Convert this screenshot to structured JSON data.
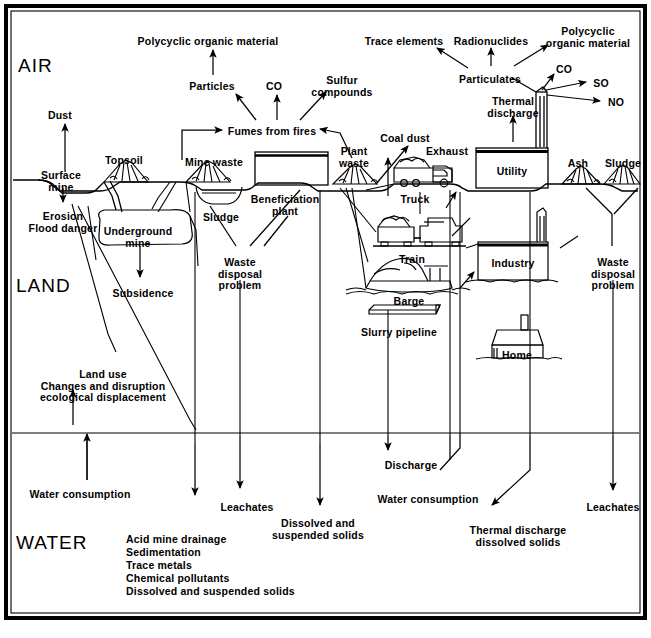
{
  "figure": {
    "zones": [
      {
        "id": "air",
        "label": "AIR"
      },
      {
        "id": "land",
        "label": "LAND"
      },
      {
        "id": "water",
        "label": "WATER"
      }
    ]
  },
  "air_labels": [
    {
      "id": "polycyclic-organic-material-left",
      "text": "Polycyclic organic material",
      "x": 208,
      "y": 36
    },
    {
      "id": "particles",
      "text": "Particles",
      "x": 212,
      "y": 81
    },
    {
      "id": "co-left",
      "text": "CO",
      "x": 274,
      "y": 81
    },
    {
      "id": "sulfur-compounds",
      "text": "Sulfur\ncompounds",
      "x": 342,
      "y": 75
    },
    {
      "id": "fumes-from-fires",
      "text": "Fumes from fires",
      "x": 272,
      "y": 126
    },
    {
      "id": "dust",
      "text": "Dust",
      "x": 60,
      "y": 110
    },
    {
      "id": "trace-elements",
      "text": "Trace elements",
      "x": 404,
      "y": 36
    },
    {
      "id": "radionuclides",
      "text": "Radionuclides",
      "x": 491,
      "y": 36
    },
    {
      "id": "polycyclic-organic-material-right",
      "text": "Polycyclic\norganic material",
      "x": 588,
      "y": 26
    },
    {
      "id": "particulates",
      "text": "Particulates",
      "x": 490,
      "y": 74
    },
    {
      "id": "co-right",
      "text": "CO",
      "x": 564,
      "y": 64
    },
    {
      "id": "so",
      "text": "SO",
      "x": 601,
      "y": 78
    },
    {
      "id": "no",
      "text": "NO",
      "x": 616,
      "y": 97
    },
    {
      "id": "thermal-discharge",
      "text": "Thermal\ndischarge",
      "x": 513,
      "y": 96
    },
    {
      "id": "coal-dust",
      "text": "Coal dust",
      "x": 405,
      "y": 133
    },
    {
      "id": "exhaust",
      "text": "Exhaust",
      "x": 447,
      "y": 146
    }
  ],
  "surface_labels": [
    {
      "id": "surface-mine",
      "text": "Surface\nmine",
      "x": 61,
      "y": 170
    },
    {
      "id": "topsoil",
      "text": "Topsoil",
      "x": 124,
      "y": 155
    },
    {
      "id": "mine-waste",
      "text": "Mine waste",
      "x": 214,
      "y": 157
    },
    {
      "id": "plant-waste",
      "text": "Plant\nwaste",
      "x": 354,
      "y": 146
    },
    {
      "id": "utility",
      "text": "Utility",
      "x": 512,
      "y": 166
    },
    {
      "id": "ash",
      "text": "Ash",
      "x": 578,
      "y": 158
    },
    {
      "id": "sludge-right",
      "text": "Sludge",
      "x": 623,
      "y": 158
    },
    {
      "id": "truck",
      "text": "Truck",
      "x": 415,
      "y": 194
    },
    {
      "id": "train",
      "text": "Train",
      "x": 412,
      "y": 254
    },
    {
      "id": "barge",
      "text": "Barge",
      "x": 409,
      "y": 296
    },
    {
      "id": "slurry-pipeline",
      "text": "Slurry pipeline",
      "x": 399,
      "y": 327
    },
    {
      "id": "industry",
      "text": "Industry",
      "x": 513,
      "y": 258
    },
    {
      "id": "home",
      "text": "Home",
      "x": 517,
      "y": 350
    },
    {
      "id": "beneficiation-plant",
      "text": "Beneficiation\nplant",
      "x": 285,
      "y": 194
    },
    {
      "id": "sludge-left",
      "text": "Sludge",
      "x": 221,
      "y": 212
    }
  ],
  "land_labels": [
    {
      "id": "erosion-flood-danger",
      "text": "Erosion\nFlood danger",
      "x": 63,
      "y": 211
    },
    {
      "id": "underground-mine",
      "text": "Underground\nmine",
      "x": 138,
      "y": 226
    },
    {
      "id": "subsidence",
      "text": "Subsidence",
      "x": 143,
      "y": 288
    },
    {
      "id": "land-use",
      "text": "Land use\nChanges and disruption\necological displacement",
      "x": 103,
      "y": 369
    },
    {
      "id": "waste-disposal-problem-left",
      "text": "Waste\ndisposal\nproblem",
      "x": 240,
      "y": 257
    },
    {
      "id": "waste-disposal-problem-right",
      "text": "Waste\ndisposal\nproblem",
      "x": 613,
      "y": 257
    }
  ],
  "water_labels": [
    {
      "id": "water-consumption-left",
      "text": "Water consumption",
      "x": 80,
      "y": 489
    },
    {
      "id": "leachates-left",
      "text": "Leachates",
      "x": 247,
      "y": 502
    },
    {
      "id": "dissolved-and-suspended-solids-mid",
      "text": "Dissolved and\nsuspended solids",
      "x": 318,
      "y": 518
    },
    {
      "id": "discharge",
      "text": "Discharge",
      "x": 411,
      "y": 460
    },
    {
      "id": "water-consumption-right",
      "text": "Water consumption",
      "x": 428,
      "y": 494
    },
    {
      "id": "thermal-discharge-dissolved-solids",
      "text": "Thermal discharge\ndissolved solids",
      "x": 518,
      "y": 525
    },
    {
      "id": "leachates-right",
      "text": "Leachates",
      "x": 613,
      "y": 502
    },
    {
      "id": "water-pollutants-list",
      "text": "Acid mine drainage\nSedimentation\nTrace metals\nChemical pollutants\nDissolved and suspended solids",
      "x": 126,
      "y": 533
    }
  ],
  "zone_positions": {
    "air": {
      "x": 18,
      "y": 55
    },
    "land": {
      "x": 16,
      "y": 275
    },
    "water": {
      "x": 16,
      "y": 532
    }
  },
  "colors": {
    "ink": "#000000",
    "background": "#ffffff",
    "boundary": "#000000"
  },
  "icon_names": [
    "truck-icon",
    "train-icon",
    "barge-icon",
    "slurry-pipeline-icon",
    "utility-plant-icon",
    "industry-plant-icon",
    "home-icon",
    "topsoil-pile-icon",
    "mine-waste-pile-icon",
    "plant-waste-pile-icon",
    "ash-pile-icon",
    "sludge-pile-icon",
    "beneficiation-plant-icon",
    "underground-mine-icon",
    "surface-mine-icon"
  ]
}
